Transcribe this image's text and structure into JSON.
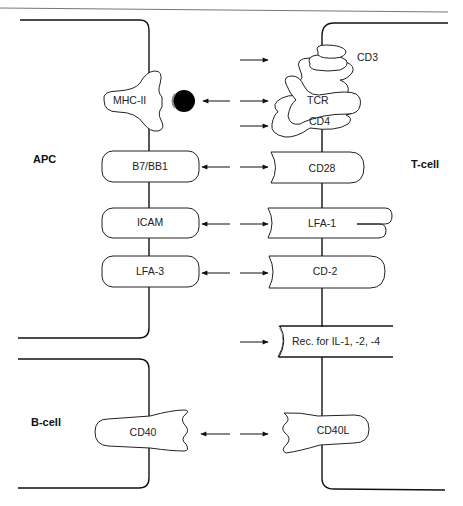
{
  "cells": {
    "apc": "APC",
    "t_cell": "T-cell",
    "b_cell": "B-cell"
  },
  "apc_molecules": {
    "mhc": "MHC-II",
    "b7": "B7/BB1",
    "icam": "ICAM",
    "lfa3": "LFA-3"
  },
  "t_cell_molecules": {
    "cd3": "CD3",
    "tcr": "TCR",
    "cd4": "CD4",
    "cd28": "CD28",
    "lfa1": "LFA-1",
    "cd2": "CD-2",
    "il_receptor": "Rec. for IL-1, -2, -4",
    "cd40l": "CD40L"
  },
  "b_cell_molecules": {
    "cd40": "CD40"
  },
  "interactions": [
    {
      "from": "MHC-II + peptide",
      "to": "TCR",
      "type": "bidirectional"
    },
    {
      "from": "B7/BB1",
      "to": "CD28",
      "type": "bidirectional"
    },
    {
      "from": "ICAM",
      "to": "LFA-1",
      "type": "bidirectional"
    },
    {
      "from": "LFA-3",
      "to": "CD-2",
      "type": "bidirectional"
    },
    {
      "from": "CD40",
      "to": "CD40L",
      "type": "bidirectional"
    },
    {
      "to": "CD3",
      "type": "incoming"
    },
    {
      "to": "CD4",
      "type": "incoming"
    },
    {
      "to": "Rec. for IL-1, -2, -4",
      "type": "incoming"
    }
  ],
  "colors": {
    "line": "#111111",
    "background": "#ffffff",
    "header_rule": "#777777"
  }
}
